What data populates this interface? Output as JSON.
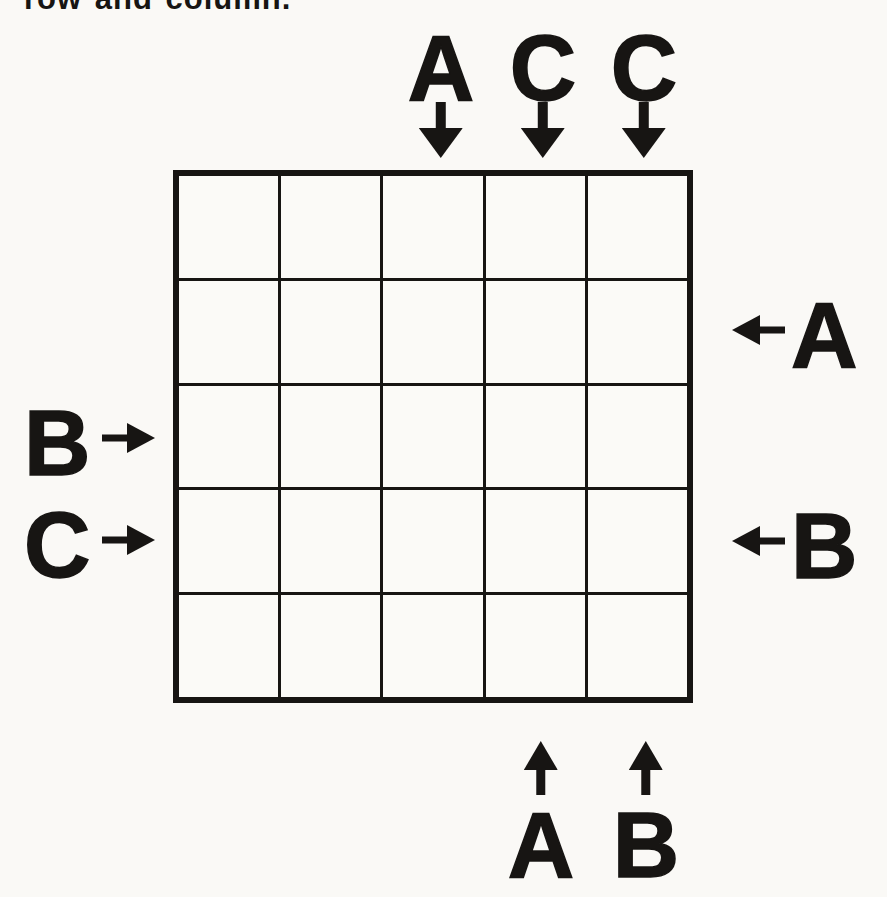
{
  "page": {
    "background_color": "#faf9f6",
    "ink_color": "#171513",
    "clipped_instruction_text": "row and column."
  },
  "puzzle": {
    "type": "abc-end-view-logic-puzzle",
    "grid": {
      "rows": 5,
      "cols": 5,
      "cells_empty": true
    },
    "clues": {
      "top": [
        {
          "col": 3,
          "letter": "A",
          "direction": "down"
        },
        {
          "col": 4,
          "letter": "C",
          "direction": "down"
        },
        {
          "col": 5,
          "letter": "C",
          "direction": "down"
        }
      ],
      "right": [
        {
          "row": 2,
          "letter": "A",
          "direction": "left"
        },
        {
          "row": 4,
          "letter": "B",
          "direction": "left"
        }
      ],
      "left": [
        {
          "row": 3,
          "letter": "B",
          "direction": "right"
        },
        {
          "row": 4,
          "letter": "C",
          "direction": "right"
        }
      ],
      "bottom": [
        {
          "col": 4,
          "letter": "A",
          "direction": "up"
        },
        {
          "col": 5,
          "letter": "B",
          "direction": "up"
        }
      ]
    }
  }
}
